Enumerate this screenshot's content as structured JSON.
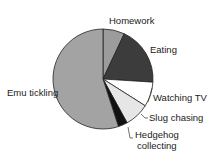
{
  "chart_data": {
    "type": "pie",
    "title": "",
    "categories": [
      "Homework",
      "Eating",
      "Watching TV",
      "Slug chasing",
      "Hedgehog collecting",
      "Emu tickling"
    ],
    "values": [
      7,
      19,
      8,
      8,
      3,
      55
    ],
    "unit": "%",
    "start_angle_deg": 0,
    "direction": "clockwise",
    "colors": [
      "#9c9c9c",
      "#3c3c3c",
      "#ffffff",
      "#e6e6e6",
      "#111111",
      "#a3a3a3"
    ],
    "legend": "none",
    "labels_outside": true
  },
  "labels": {
    "homework": "Homework",
    "eating": "Eating",
    "watching_tv": "Watching TV",
    "slug_chasing": "Slug chasing",
    "hedgehog_line1": "Hedgehog",
    "hedgehog_line2": "collecting",
    "emu_tickling": "Emu tickling"
  }
}
